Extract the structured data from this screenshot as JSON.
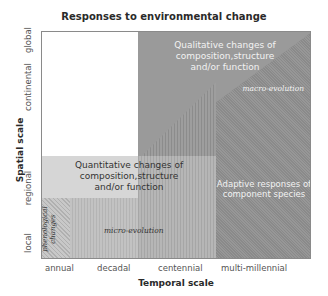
{
  "title": "Responses to environmental change",
  "axes": {
    "x_label": "Temporal scale",
    "y_label": "Spatial scale",
    "x_ticks": [
      "annual",
      "decadal",
      "centennial",
      "multi-millennial"
    ],
    "y_ticks": [
      "local",
      "regional",
      "continental",
      "global"
    ]
  },
  "regions": {
    "qualitative": "Qualitative changes of composition,structure and/or function",
    "qualitative_lines": [
      "Qualitative changes of",
      "composition,structure",
      "and/or function"
    ],
    "quantitative_lines": [
      "Quantitative changes of",
      "composition,structure",
      "and/or function"
    ],
    "macro_evolution": "macro-evolution",
    "adaptive_lines": [
      "Adaptive responses of",
      "component species"
    ],
    "micro_evolution": "micro-evolution",
    "phenological_lines": [
      "phenological",
      "changes"
    ]
  },
  "colors": {
    "qualitative_fill": "#9a9a9a",
    "quantitative_fill": "#d6d6d6",
    "macro_fill": "#8e8e8e",
    "micro_fill": "#bcbcbc",
    "border": "#8a8a8a"
  }
}
